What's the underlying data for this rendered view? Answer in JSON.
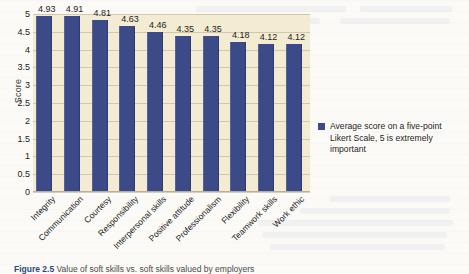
{
  "chart_data": {
    "type": "bar",
    "title": "",
    "xlabel": "",
    "ylabel": "Score",
    "ylim": [
      0,
      5
    ],
    "ytick_step": 0.5,
    "grid": true,
    "legend_position": "right",
    "categories": [
      "Integrity",
      "Communication",
      "Courtesy",
      "Responsibility",
      "Interpersonal skills",
      "Positive attitude",
      "Professionalism",
      "Flexibility",
      "Teamwork skills",
      "Work ethic"
    ],
    "values": [
      4.93,
      4.91,
      4.81,
      4.63,
      4.46,
      4.35,
      4.35,
      4.18,
      4.12,
      4.12
    ],
    "value_labels": [
      "4.93",
      "4.91",
      "4.81",
      "4.63",
      "4.46",
      "4.35",
      "4.35",
      "4.18",
      "4.12",
      "4.12"
    ],
    "yticks": [
      "0",
      "0.5",
      "1",
      "1.5",
      "2",
      "2.5",
      "3",
      "3.5",
      "4",
      "4.5",
      "5"
    ],
    "series": [
      {
        "name": "Average score on a five-point Likert Scale, 5 is extremely important",
        "values": [
          4.93,
          4.91,
          4.81,
          4.63,
          4.46,
          4.35,
          4.35,
          4.18,
          4.12,
          4.12
        ],
        "color": "#3d4a88"
      }
    ],
    "colors": {
      "bar": "#3d4a88",
      "plot_background": "#f4ecd2",
      "page_background": "#fbfaf7",
      "gridline": "#b4aa91",
      "axis": "#b9ada0",
      "text": "#222222"
    }
  },
  "legend": {
    "entries": [
      {
        "label": "Average score on a five-point Likert Scale, 5 is extremely important",
        "color": "#3d4a88"
      }
    ]
  },
  "caption": {
    "figure_number": "Figure 2.5",
    "text": "Value of soft skills vs. soft skills valued by employers"
  }
}
